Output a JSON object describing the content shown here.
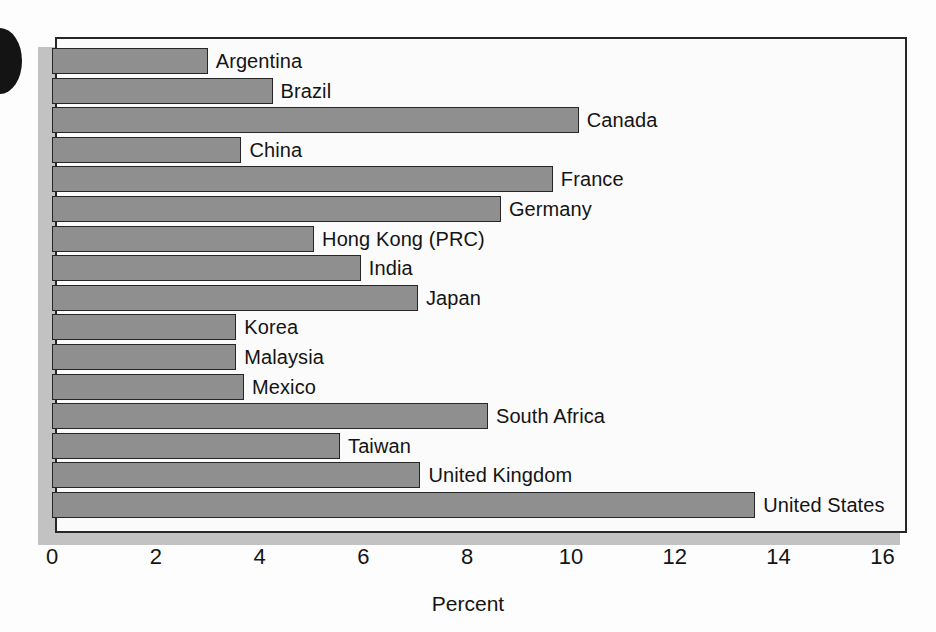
{
  "chart_data": {
    "type": "bar",
    "orientation": "horizontal",
    "title": "",
    "xlabel": "Percent",
    "ylabel": "",
    "xlim": [
      0,
      16
    ],
    "xticks": [
      0,
      2,
      4,
      6,
      8,
      10,
      12,
      14,
      16
    ],
    "xtick_labels": [
      "0",
      "2",
      "4",
      "6",
      "8",
      "10",
      "12",
      "14",
      "16"
    ],
    "grid": false,
    "legend": null,
    "bar_color": "#8f8f8f",
    "bar_edge_color": "#262626",
    "categories": [
      "Argentina",
      "Brazil",
      "Canada",
      "China",
      "France",
      "Germany",
      "Hong Kong (PRC)",
      "India",
      "Japan",
      "Korea",
      "Malaysia",
      "Mexico",
      "South Africa",
      "Taiwan",
      "United Kingdom",
      "United States"
    ],
    "values": [
      3.0,
      4.25,
      10.15,
      3.65,
      9.65,
      8.65,
      5.05,
      5.95,
      7.05,
      3.55,
      3.55,
      3.7,
      8.4,
      5.55,
      7.1,
      13.55
    ]
  },
  "axis": {
    "x_title": "Percent",
    "ticks": [
      "0",
      "2",
      "4",
      "6",
      "8",
      "10",
      "12",
      "14",
      "16"
    ]
  },
  "bars": [
    {
      "label": "Argentina",
      "value": 3.0
    },
    {
      "label": "Brazil",
      "value": 4.25
    },
    {
      "label": "Canada",
      "value": 10.15
    },
    {
      "label": "China",
      "value": 3.65
    },
    {
      "label": "France",
      "value": 9.65
    },
    {
      "label": "Germany",
      "value": 8.65
    },
    {
      "label": "Hong Kong (PRC)",
      "value": 5.05
    },
    {
      "label": "India",
      "value": 5.95
    },
    {
      "label": "Japan",
      "value": 7.05
    },
    {
      "label": "Korea",
      "value": 3.55
    },
    {
      "label": "Malaysia",
      "value": 3.55
    },
    {
      "label": "Mexico",
      "value": 3.7
    },
    {
      "label": "South Africa",
      "value": 8.4
    },
    {
      "label": "Taiwan",
      "value": 5.55
    },
    {
      "label": "United Kingdom",
      "value": 7.1
    },
    {
      "label": "United States",
      "value": 13.55
    }
  ]
}
